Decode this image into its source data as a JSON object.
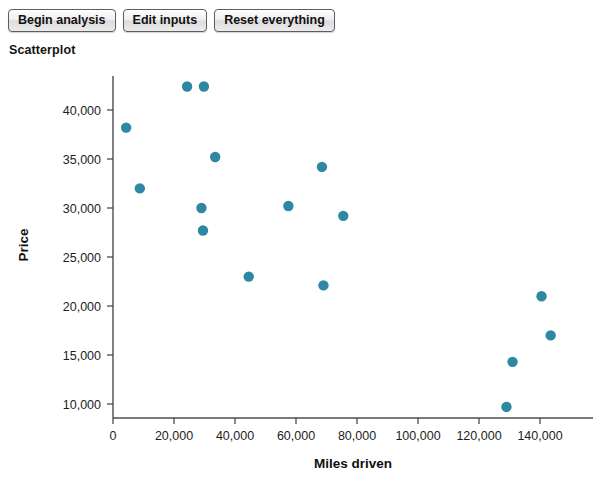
{
  "toolbar": {
    "buttons": [
      {
        "label": "Begin analysis",
        "name": "begin-analysis-button"
      },
      {
        "label": "Edit inputs",
        "name": "edit-inputs-button"
      },
      {
        "label": "Reset everything",
        "name": "reset-everything-button"
      }
    ]
  },
  "chart_title": "Scatterplot",
  "colors": {
    "marker": "#2e87a3",
    "axis": "#4c4c4c",
    "text": "#1d1d1d",
    "background": "#ffffff"
  },
  "chart_data": {
    "type": "scatter",
    "title": "Scatterplot",
    "xlabel": "Miles driven",
    "ylabel": "Price",
    "xlim": [
      0,
      150000
    ],
    "ylim": [
      7000,
      44000
    ],
    "grid": false,
    "legend": null,
    "xticks": [
      0,
      20000,
      40000,
      60000,
      80000,
      100000,
      120000,
      140000
    ],
    "xtick_labels": [
      "0",
      "20,000",
      "40,000",
      "60,000",
      "80,000",
      "100,000",
      "120,000",
      "140,000"
    ],
    "yticks": [
      10000,
      15000,
      20000,
      25000,
      30000,
      35000,
      40000
    ],
    "ytick_labels": [
      "10,000",
      "15,000",
      "20,000",
      "25,000",
      "30,000",
      "35,000",
      "40,000"
    ],
    "series": [
      {
        "name": "Cars",
        "marker": "circle",
        "color": "#2e87a3",
        "points": [
          {
            "x": 4300,
            "y": 38200
          },
          {
            "x": 8800,
            "y": 32000
          },
          {
            "x": 24300,
            "y": 42400
          },
          {
            "x": 29800,
            "y": 42400
          },
          {
            "x": 29000,
            "y": 30000
          },
          {
            "x": 29500,
            "y": 27700
          },
          {
            "x": 33500,
            "y": 35200
          },
          {
            "x": 44500,
            "y": 23000
          },
          {
            "x": 57500,
            "y": 30200
          },
          {
            "x": 68500,
            "y": 34200
          },
          {
            "x": 69000,
            "y": 22100
          },
          {
            "x": 75500,
            "y": 29200
          },
          {
            "x": 129000,
            "y": 9700
          },
          {
            "x": 131000,
            "y": 14300
          },
          {
            "x": 140500,
            "y": 21000
          },
          {
            "x": 143500,
            "y": 17000
          }
        ]
      }
    ]
  }
}
